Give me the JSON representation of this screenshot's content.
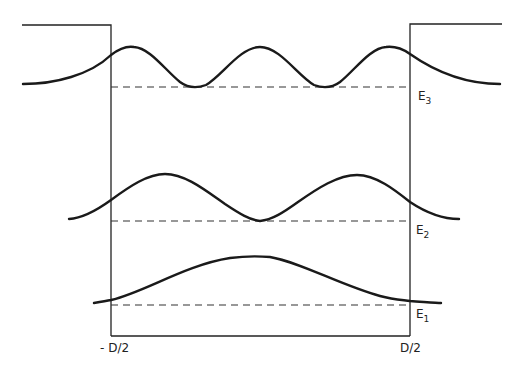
{
  "diagram": {
    "type": "quantum-well-wavefunctions",
    "well": {
      "left_label": "- D/2",
      "right_label": "D/2",
      "color": "#222222"
    },
    "levels": [
      {
        "id": "E3",
        "label_main": "E",
        "label_sub": "3",
        "nodes_inside": 2
      },
      {
        "id": "E2",
        "label_main": "E",
        "label_sub": "2",
        "nodes_inside": 1
      },
      {
        "id": "E1",
        "label_main": "E",
        "label_sub": "1",
        "nodes_inside": 0
      }
    ],
    "line_color": "#1a1a1a"
  }
}
